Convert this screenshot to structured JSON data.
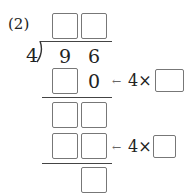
{
  "problem": {
    "label": "(2)",
    "divisor": "4",
    "dividend_digits": [
      "9",
      "6"
    ],
    "step1_known_digit": "0",
    "arrow": "←",
    "multiplier_prefix_1": "4×",
    "multiplier_prefix_2": "4×",
    "quotient_boxes": 2,
    "answer_boxes_total": 9
  }
}
